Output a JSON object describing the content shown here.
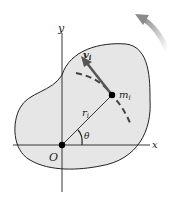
{
  "diagram": {
    "type": "rigid-body-rotation",
    "labels": {
      "x_axis": "x",
      "y_axis": "y",
      "origin": "O",
      "mass": "m",
      "mass_sub": "i",
      "velocity": "v",
      "velocity_sub": "i",
      "radius": "r",
      "radius_sub": "i",
      "angle": "θ"
    },
    "colors": {
      "body_fill": "#e6e6e6",
      "outline": "#222222",
      "velocity_arrow": "#555555",
      "rotation_arrow": "#9a9a9a",
      "dashed_path": "#444444",
      "point": "#000000"
    },
    "elements": [
      "irregular rigid body (blob)",
      "x-y axes through origin O",
      "particle m_i at position r_i",
      "velocity vector v_i tangent to circular path",
      "dashed circular path",
      "angle θ between x-axis and r_i",
      "curved rotation arrow (counterclockwise) at top-right"
    ]
  }
}
